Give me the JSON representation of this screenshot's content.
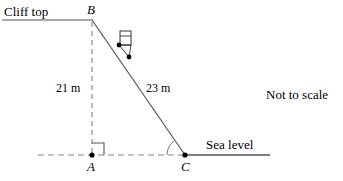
{
  "figure": {
    "title_note": "Not to scale",
    "cliff_top_label": "Cliff top",
    "sea_level_label": "Sea level",
    "points": {
      "B": "B",
      "A": "A",
      "C": "C"
    },
    "measurements": {
      "vertical": "21 m",
      "hypotenuse": "23 m"
    },
    "colors": {
      "stroke": "#000000",
      "dashed": "#808080",
      "line": "#555555",
      "background": "#ffffff"
    },
    "geometry": {
      "B": [
        92,
        20
      ],
      "A": [
        92,
        155
      ],
      "C": [
        185,
        155
      ],
      "cliff_line_from_x": 2,
      "cliff_line_to_x": 92,
      "sea_dash_from_x": 38,
      "sea_solid_to_x": 270,
      "right_angle_at": "A",
      "angle_marked_at": "C"
    }
  }
}
